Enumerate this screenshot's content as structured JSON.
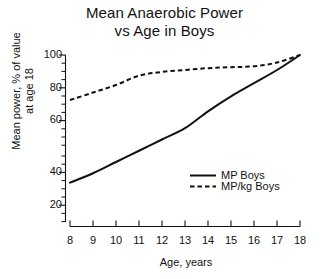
{
  "chart_data": {
    "type": "line",
    "title": "Mean Anaerobic Power vs Age in Boys",
    "title_line1": "Mean Anaerobic Power",
    "title_line2": "vs Age in Boys",
    "xlabel": "Age, years",
    "ylabel": "Mean power, % of value at age 18",
    "ylabel_line1": "Mean power, % of value",
    "ylabel_line2": "at age 18",
    "x": [
      8,
      9,
      10,
      11,
      12,
      13,
      14,
      15,
      16,
      17,
      18
    ],
    "xlim": [
      8,
      18
    ],
    "ylim": [
      14,
      100
    ],
    "xticks": [
      "8",
      "9",
      "10",
      "11",
      "12",
      "13",
      "14",
      "15",
      "16",
      "17",
      "18"
    ],
    "yticks": [
      "20",
      "40",
      "60",
      "80",
      "100"
    ],
    "yticks_minor_step": 5,
    "grid": false,
    "legend_position": "inside-lower-right",
    "series": [
      {
        "name": "MP Boys",
        "style": "solid",
        "color": "#111111",
        "values": [
          32,
          37,
          43,
          49,
          55,
          61,
          70,
          78,
          85,
          92,
          100
        ]
      },
      {
        "name": "MP/kg Boys",
        "style": "dashed",
        "color": "#111111",
        "values": [
          76,
          80,
          84,
          89,
          91,
          92,
          93,
          93.5,
          94,
          96,
          100
        ]
      }
    ]
  },
  "axis": {
    "x_axis_name": "x-axis",
    "y_axis_name": "y-axis"
  }
}
